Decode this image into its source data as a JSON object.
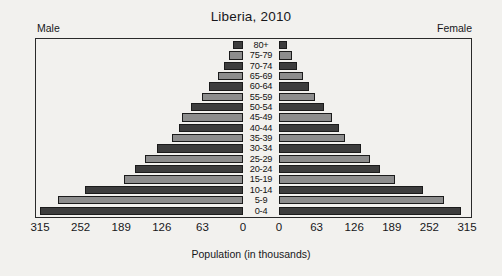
{
  "chart_data": {
    "type": "bar",
    "subtype": "population-pyramid",
    "title": "Liberia, 2010",
    "xlabel": "Population (in thousands)",
    "ylabel": "",
    "categories": [
      "80+",
      "75-79",
      "70-74",
      "65-69",
      "60-64",
      "55-59",
      "50-54",
      "45-49",
      "40-44",
      "35-39",
      "30-34",
      "25-29",
      "20-24",
      "15-19",
      "10-14",
      "5-9",
      "0-4"
    ],
    "series": [
      {
        "name": "Male",
        "side": "left",
        "values": [
          16,
          22,
          30,
          39,
          53,
          64,
          80,
          94,
          99,
          110,
          133,
          152,
          168,
          185,
          245,
          287,
          315
        ]
      },
      {
        "name": "Female",
        "side": "right",
        "values": [
          13,
          21,
          30,
          40,
          51,
          60,
          76,
          88,
          100,
          110,
          137,
          153,
          170,
          195,
          242,
          276,
          305
        ]
      }
    ],
    "xlim": [
      0,
      315
    ],
    "xticks": [
      0,
      63,
      126,
      189,
      252,
      315
    ],
    "grid": false,
    "legend_position": "corners",
    "colors": {
      "dark_bar": "#3d3d3d",
      "light_bar": "#8d8d8d",
      "outline": "#1b1b1b",
      "background": "#f2f1ee"
    }
  },
  "title": "Liberia, 2010",
  "labels": {
    "male": "Male",
    "female": "Female",
    "axis_caption": "Population (in thousands)"
  },
  "axis": {
    "male_ticks": [
      "315",
      "252",
      "189",
      "126",
      "63",
      "0"
    ],
    "female_ticks": [
      "0",
      "63",
      "126",
      "189",
      "252",
      "315"
    ]
  }
}
